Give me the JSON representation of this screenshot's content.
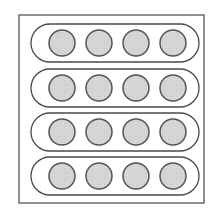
{
  "diagram": {
    "outer_frame": {
      "x": 19,
      "y": 15,
      "width": 185,
      "height": 188
    },
    "rows": 4,
    "columns": 4,
    "pill": {
      "x": 31,
      "width": 168,
      "height": 38,
      "tops": [
        24,
        69,
        113,
        157
      ]
    },
    "circle": {
      "centers_x": [
        62,
        99,
        136,
        173
      ],
      "radius": 13
    },
    "colors": {
      "frame_stroke": "#555555",
      "pill_stroke": "#4a4a4a",
      "circle_fill": "#d8d8d8",
      "circle_stroke": "#555555",
      "background": "#ffffff"
    }
  }
}
